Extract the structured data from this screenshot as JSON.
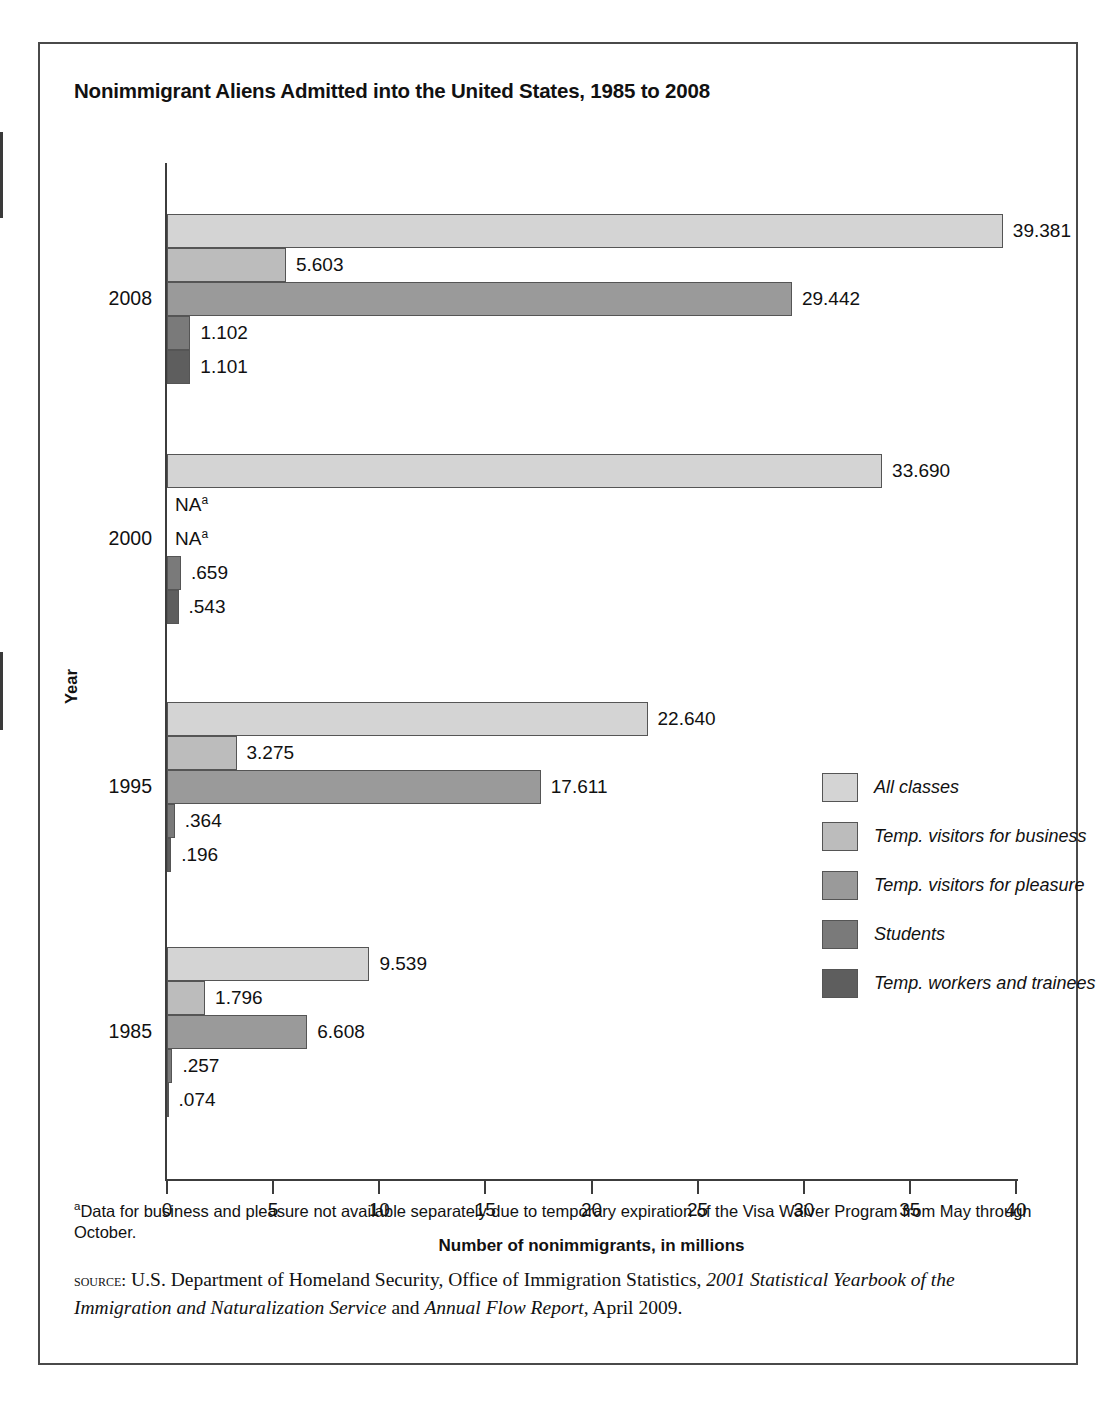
{
  "title": "Nonimmigrant Aliens Admitted into the United States, 1985 to 2008",
  "axes": {
    "ylabel": "Year",
    "xlabel": "Number of nonimmigrants, in millions",
    "xticks": [
      "0",
      "5",
      "10",
      "15",
      "20",
      "25",
      "30",
      "35",
      "40"
    ]
  },
  "legend": [
    {
      "label": "All classes",
      "color": "#d4d4d4"
    },
    {
      "label": "Temp. visitors for business",
      "color": "#bcbcbc"
    },
    {
      "label": "Temp. visitors for pleasure",
      "color": "#9a9a9a"
    },
    {
      "label": "Students",
      "color": "#7a7a7a"
    },
    {
      "label": "Temp. workers and trainees",
      "color": "#5e5e5e"
    }
  ],
  "footnote_marker": "a",
  "footnote_text": "Data for business and pleasure not available separately due to temporary expiration of the Visa Waiver Program from May through October.",
  "source_prefix": "source:",
  "source_part1": " U.S. Department of Homeland Security, Office of Immigration Statistics, ",
  "source_italic1": "2001 Statistical Yearbook of the Immigration and Naturalization Service",
  "source_mid": " and ",
  "source_italic2": "Annual Flow Report",
  "source_part2": ", April 2009.",
  "chart_data": {
    "type": "bar",
    "orientation": "horizontal",
    "title": "Nonimmigrant Aliens Admitted into the United States, 1985 to 2008",
    "xlabel": "Number of nonimmigrants, in millions",
    "ylabel": "Year",
    "xlim": [
      0,
      40
    ],
    "grid": false,
    "legend_position": "right",
    "categories": [
      "2008",
      "2000",
      "1995",
      "1985"
    ],
    "series": [
      {
        "name": "All classes",
        "color": "#d4d4d4",
        "values": [
          39.381,
          33.69,
          22.64,
          9.539
        ],
        "labels": [
          "39.381",
          "33.690",
          "22.640",
          "9.539"
        ]
      },
      {
        "name": "Temp. visitors for business",
        "color": "#bcbcbc",
        "values": [
          5.603,
          null,
          3.275,
          1.796
        ],
        "labels": [
          "5.603",
          "NA",
          "3.275",
          "1.796"
        ]
      },
      {
        "name": "Temp. visitors for pleasure",
        "color": "#9a9a9a",
        "values": [
          29.442,
          null,
          17.611,
          6.608
        ],
        "labels": [
          "29.442",
          "NA",
          "17.611",
          "6.608"
        ]
      },
      {
        "name": "Students",
        "color": "#7a7a7a",
        "values": [
          1.102,
          0.659,
          0.364,
          0.257
        ],
        "labels": [
          "1.102",
          ".659",
          ".364",
          ".257"
        ]
      },
      {
        "name": "Temp. workers and trainees",
        "color": "#5e5e5e",
        "values": [
          1.101,
          0.543,
          0.196,
          0.074
        ],
        "labels": [
          "1.101",
          ".543",
          ".196",
          ".074"
        ]
      }
    ]
  },
  "groups": [
    {
      "year": "2008",
      "bars": [
        {
          "label": "39.381",
          "value": 39.381,
          "na": false
        },
        {
          "label": "5.603",
          "value": 5.603,
          "na": false
        },
        {
          "label": "29.442",
          "value": 29.442,
          "na": false
        },
        {
          "label": "1.102",
          "value": 1.102,
          "na": false
        },
        {
          "label": "1.101",
          "value": 1.101,
          "na": false
        }
      ]
    },
    {
      "year": "2000",
      "bars": [
        {
          "label": "33.690",
          "value": 33.69,
          "na": false
        },
        {
          "label": "NA",
          "value": 0,
          "na": true
        },
        {
          "label": "NA",
          "value": 0,
          "na": true
        },
        {
          "label": ".659",
          "value": 0.659,
          "na": false
        },
        {
          "label": ".543",
          "value": 0.543,
          "na": false
        }
      ]
    },
    {
      "year": "1995",
      "bars": [
        {
          "label": "22.640",
          "value": 22.64,
          "na": false
        },
        {
          "label": "3.275",
          "value": 3.275,
          "na": false
        },
        {
          "label": "17.611",
          "value": 17.611,
          "na": false
        },
        {
          "label": ".364",
          "value": 0.364,
          "na": false
        },
        {
          "label": ".196",
          "value": 0.196,
          "na": false
        }
      ]
    },
    {
      "year": "1985",
      "bars": [
        {
          "label": "9.539",
          "value": 9.539,
          "na": false
        },
        {
          "label": "1.796",
          "value": 1.796,
          "na": false
        },
        {
          "label": "6.608",
          "value": 6.608,
          "na": false
        },
        {
          "label": ".257",
          "value": 0.257,
          "na": false
        },
        {
          "label": ".074",
          "value": 0.074,
          "na": false
        }
      ]
    }
  ]
}
